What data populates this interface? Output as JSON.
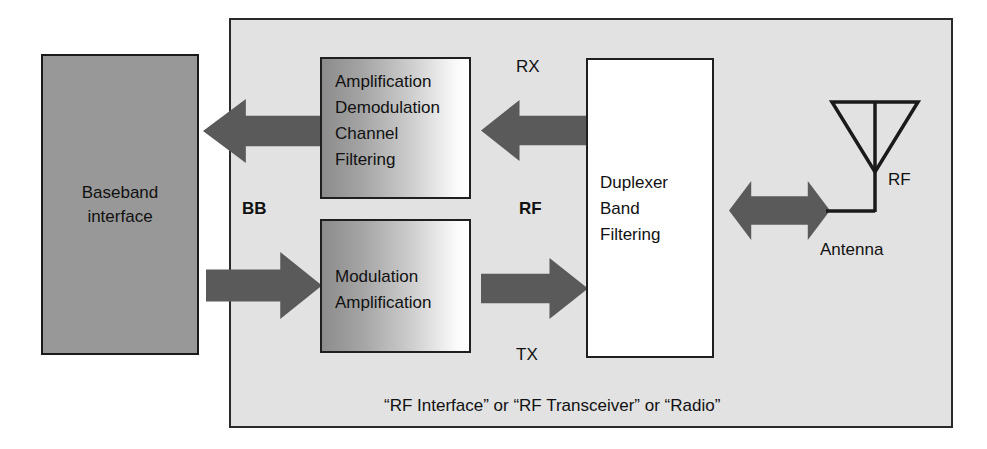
{
  "diagram": {
    "title_caption": "“RF Interface” or “RF Transceiver” or “Radio”",
    "baseband": {
      "label_line1": "Baseband",
      "label_line2": "interface",
      "fill_color": "#989898"
    },
    "rf_container": {
      "fill_color": "#e2e2e2",
      "border_color": "#2a2a2a"
    },
    "blocks": [
      {
        "name": "receive-chain",
        "lines": [
          "Amplification",
          "Demodulation",
          "Channel",
          "Filtering"
        ]
      },
      {
        "name": "transmit-chain",
        "lines": [
          "Modulation",
          "Amplification"
        ]
      },
      {
        "name": "duplexer",
        "lines": [
          "Duplexer",
          "Band",
          "Filtering"
        ]
      }
    ],
    "labels": {
      "bb": "BB",
      "rf_mid": "RF",
      "rx": "RX",
      "tx": "TX",
      "rf_antenna": "RF",
      "antenna": "Antenna"
    },
    "arrows": [
      {
        "name": "baseband-rx-arrow",
        "direction": "left",
        "color": "#5a5a5a"
      },
      {
        "name": "duplexer-rx-arrow",
        "direction": "left",
        "color": "#5a5a5a"
      },
      {
        "name": "baseband-tx-arrow",
        "direction": "right",
        "color": "#5a5a5a"
      },
      {
        "name": "duplexer-tx-arrow",
        "direction": "right",
        "color": "#5a5a5a"
      },
      {
        "name": "antenna-arrow",
        "direction": "both",
        "color": "#5a5a5a"
      }
    ]
  }
}
